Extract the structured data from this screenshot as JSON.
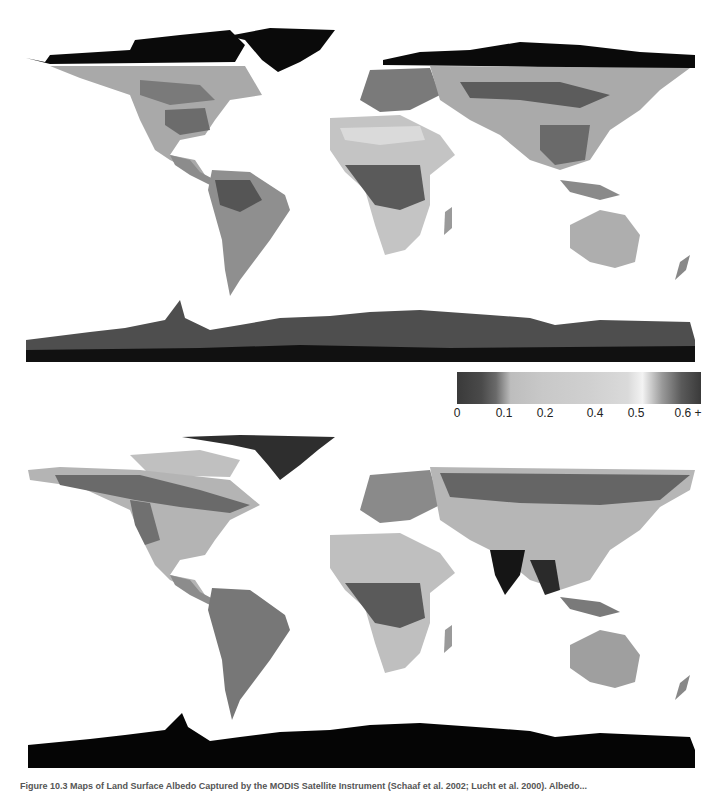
{
  "figure": {
    "panels": [
      {
        "id": "top",
        "description": "Global land surface albedo map (snow-covered season: Arctic, Greenland, Antarctica dark/black)"
      },
      {
        "id": "bottom",
        "description": "Global land surface albedo map (alternate season: Greenland and Antarctica black, India dark)"
      }
    ],
    "colorbar": {
      "ticks": [
        {
          "label": "0",
          "x": 0
        },
        {
          "label": "0.1",
          "x": 0.15
        },
        {
          "label": "0.2",
          "x": 0.3
        },
        {
          "label": "0.4",
          "x": 0.5
        },
        {
          "label": "0.5",
          "x": 0.7
        },
        {
          "label": "0.6 +",
          "x": 0.95
        }
      ],
      "range": [
        0,
        0.6
      ]
    },
    "caption": "Figure 10.3 Maps of Land Surface Albedo Captured by the MODIS Satellite Instrument (Schaaf et al. 2002; Lucht et al. 2000). Albedo..."
  },
  "colors": {
    "ocean": "#ffffff",
    "ice_black": "#0a0a0a",
    "dark_gray": "#555555",
    "mid_gray": "#8a8a8a",
    "light_gray": "#b8b8b8",
    "desert": "#c6c6c6"
  }
}
